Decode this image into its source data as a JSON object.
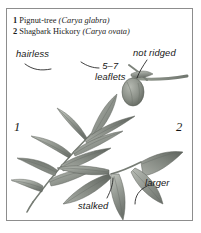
{
  "plate": {
    "border_color": "#8d8d8d",
    "background": "#ffffff"
  },
  "caption": {
    "entries": [
      {
        "number": "1",
        "common_name": "Pignut-tree",
        "scientific_name": "(Carya glabra)"
      },
      {
        "number": "2",
        "common_name": "Shagbark Hickory",
        "scientific_name": "(Carya ovata)"
      }
    ]
  },
  "annotations": {
    "hairless": "hairless",
    "not_ridged": "not ridged",
    "leaflets_count": "5–7",
    "leaflets_word": "leaflets",
    "larger": "larger",
    "stalked": "stalked"
  },
  "markers": {
    "left_figure": "1",
    "right_figure": "2"
  },
  "illustration": {
    "description": "Grayscale botanical drawing of two hickory compound leaves and a budded twig",
    "ink_color": "#7f837d",
    "outline_color": "#555a54",
    "leader_color": "#1d1d1d"
  }
}
